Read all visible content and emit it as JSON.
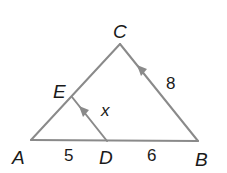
{
  "diagram": {
    "type": "geometry",
    "line_color": "#8a8a8a",
    "text_color": "#1a1a1a",
    "points": {
      "A": {
        "label": "A",
        "x": 31,
        "y": 140
      },
      "B": {
        "label": "B",
        "x": 198,
        "y": 141
      },
      "C": {
        "label": "C",
        "x": 120,
        "y": 44
      },
      "D": {
        "label": "D",
        "x": 107,
        "y": 141
      },
      "E": {
        "label": "E",
        "x": 72,
        "y": 97
      }
    },
    "segments": [
      {
        "from": "A",
        "to": "B"
      },
      {
        "from": "A",
        "to": "C"
      },
      {
        "from": "C",
        "to": "B"
      },
      {
        "from": "E",
        "to": "D"
      }
    ],
    "parallel_marks": [
      "ED",
      "BC"
    ],
    "measures": {
      "AD": "5",
      "DB": "6",
      "CB": "8",
      "ED": "x"
    }
  }
}
